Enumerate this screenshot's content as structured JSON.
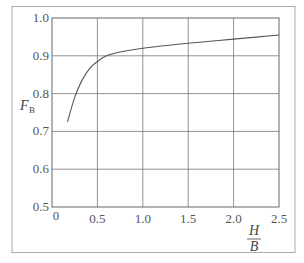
{
  "chart_data": {
    "type": "line",
    "title": "",
    "xlabel_num": "H",
    "xlabel_den": "B",
    "ylabel_main": "F",
    "ylabel_sub": "B",
    "xlim": [
      0,
      2.5
    ],
    "ylim": [
      0.5,
      1.0
    ],
    "xticks": [
      "0",
      "0.5",
      "1.0",
      "1.5",
      "2.0",
      "2.5"
    ],
    "yticks": [
      "0.5",
      "0.6",
      "0.7",
      "0.8",
      "0.9",
      "1.0"
    ],
    "grid": true,
    "legend": null,
    "series": [
      {
        "name": "F_B",
        "x": [
          0.17,
          0.25,
          0.33,
          0.42,
          0.5,
          0.6,
          0.75,
          1.0,
          1.5,
          2.0,
          2.5
        ],
        "y": [
          0.725,
          0.79,
          0.835,
          0.868,
          0.885,
          0.9,
          0.91,
          0.92,
          0.933,
          0.944,
          0.955
        ]
      }
    ]
  }
}
